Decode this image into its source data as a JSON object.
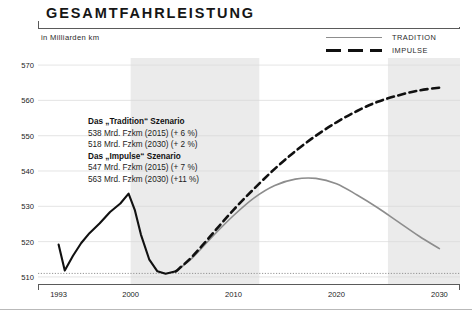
{
  "header": {
    "title": "GESAMTFAHRLEISTUNG",
    "subtitle": "in Milliarden km"
  },
  "legend": {
    "position": "top-right",
    "items": [
      {
        "label": "TRADITION",
        "style": "solid",
        "color": "#8d8d8d"
      },
      {
        "label": "IMPULSE",
        "style": "dashed",
        "color": "#101010"
      }
    ]
  },
  "annotation": {
    "tradition_heading": "Das „Tradition“ Szenario",
    "tradition_line1": "538 Mrd. Fzkm (2015) (+ 6 %)",
    "tradition_line2": "518 Mrd. Fzkm (2030) (+ 2 %)",
    "impulse_heading": "Das „Impulse“ Szenario",
    "impulse_line1": "547 Mrd. Fzkm (2015) (+ 7 %)",
    "impulse_line2": "563 Mrd. Fzkm (2030) (+11 %)"
  },
  "axes": {
    "y_ticks": [
      "570",
      "560",
      "550",
      "540",
      "530",
      "520",
      "510"
    ],
    "x_ticks": [
      "1993",
      "2000",
      "2010",
      "2020",
      "2030"
    ]
  },
  "chart_data": {
    "type": "line",
    "title": "GESAMTFAHRLEISTUNG",
    "subtitle": "in Milliarden km",
    "xlabel": "",
    "ylabel": "in Milliarden km",
    "xlim": [
      1991,
      2032
    ],
    "ylim": [
      508,
      572
    ],
    "ytick_values": [
      570,
      560,
      550,
      540,
      530,
      520,
      510
    ],
    "xtick_values": [
      1993,
      2000,
      2010,
      2020,
      2030
    ],
    "grid": true,
    "legend_position": "top-right",
    "shaded_bands": [
      {
        "from": 2000,
        "to": 2012.5,
        "color": "#ebebeb"
      },
      {
        "from": 2025,
        "to": 2032,
        "color": "#ebebeb"
      }
    ],
    "reference_line": {
      "y": 511,
      "style": "dotted",
      "color": "#8a8a8a"
    },
    "series": [
      {
        "name": "HISTORY",
        "style": "solid",
        "color": "#111111",
        "width": 2.1,
        "points": [
          [
            1993,
            519.2
          ],
          [
            1993.6,
            511.8
          ],
          [
            1994.4,
            516.0
          ],
          [
            1995.2,
            519.6
          ],
          [
            1996.0,
            522.4
          ],
          [
            1997.0,
            525.2
          ],
          [
            1998.0,
            528.4
          ],
          [
            1999.0,
            530.8
          ],
          [
            1999.8,
            533.6
          ],
          [
            2000.4,
            529.0
          ],
          [
            2001.0,
            522.0
          ],
          [
            2001.8,
            515.0
          ],
          [
            2002.6,
            511.6
          ],
          [
            2003.4,
            510.9
          ],
          [
            2004.4,
            511.6
          ]
        ]
      },
      {
        "name": "TRADITION",
        "style": "solid",
        "color": "#8d8d8d",
        "width": 1.6,
        "points": [
          [
            2004.4,
            511.6
          ],
          [
            2006,
            515.4
          ],
          [
            2008,
            521.6
          ],
          [
            2010,
            527.4
          ],
          [
            2012,
            532.4
          ],
          [
            2014,
            535.9
          ],
          [
            2016,
            537.7
          ],
          [
            2018,
            537.9
          ],
          [
            2020,
            536.4
          ],
          [
            2022,
            533.2
          ],
          [
            2024,
            529.6
          ],
          [
            2026,
            525.6
          ],
          [
            2028,
            521.6
          ],
          [
            2030,
            518.0
          ]
        ]
      },
      {
        "name": "IMPULSE",
        "style": "dashed",
        "color": "#101010",
        "width": 2.6,
        "points": [
          [
            2004.4,
            511.6
          ],
          [
            2006,
            515.8
          ],
          [
            2008,
            522.4
          ],
          [
            2010,
            529.0
          ],
          [
            2012,
            535.0
          ],
          [
            2014,
            540.6
          ],
          [
            2016,
            545.6
          ],
          [
            2018,
            550.0
          ],
          [
            2020,
            553.8
          ],
          [
            2022,
            557.0
          ],
          [
            2024,
            559.6
          ],
          [
            2026,
            561.4
          ],
          [
            2028,
            562.8
          ],
          [
            2030,
            563.6
          ]
        ]
      }
    ],
    "annotations": [
      "Das „Tradition“ Szenario",
      "538 Mrd. Fzkm (2015) (+ 6 %)",
      "518 Mrd. Fzkm (2030) (+ 2 %)",
      "Das „Impulse“ Szenario",
      "547 Mrd. Fzkm (2015) (+ 7 %)",
      "563 Mrd. Fzkm (2030) (+11 %)"
    ]
  }
}
